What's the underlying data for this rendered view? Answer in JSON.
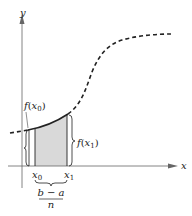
{
  "figure": {
    "axes": {
      "x_label": "x",
      "y_label": "y"
    },
    "curve": {
      "description": "increasing S-shaped function, dashed except over first subinterval",
      "style": "dashed"
    },
    "labels": {
      "f_x0": {
        "func": "f",
        "open": "(",
        "var": "x",
        "sub": "0",
        "close": ")"
      },
      "f_x1": {
        "func": "f",
        "open": "(",
        "var": "x",
        "sub": "1",
        "close": ")"
      },
      "x0": {
        "var": "x",
        "sub": "0"
      },
      "x1": {
        "var": "x",
        "sub": "1"
      },
      "width_fraction": {
        "numerator": "b − a",
        "denominator": "n"
      }
    },
    "colors": {
      "stroke": "#222222",
      "shade": "#d9d9d9",
      "axis": "#555555"
    }
  }
}
